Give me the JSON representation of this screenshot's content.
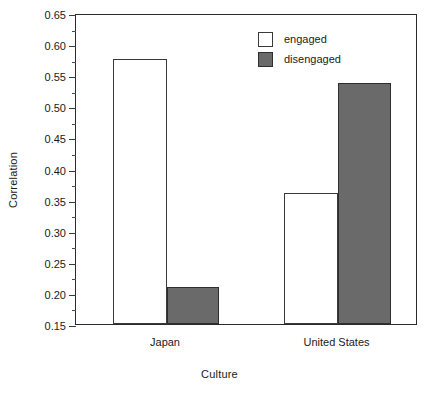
{
  "chart_data": {
    "type": "bar",
    "title": "",
    "xlabel": "Culture",
    "ylabel": "Correlation",
    "categories": [
      "Japan",
      "United States"
    ],
    "series": [
      {
        "name": "engaged",
        "color": "#ffffff",
        "values": [
          0.576,
          0.361
        ]
      },
      {
        "name": "disengaged",
        "color": "#6a6a6a",
        "values": [
          0.21,
          0.537
        ]
      }
    ],
    "ylim": [
      0.15,
      0.65
    ],
    "ytick_step": 0.05,
    "yticks": [
      0.15,
      0.2,
      0.25,
      0.3,
      0.35,
      0.4,
      0.45,
      0.5,
      0.55,
      0.6,
      0.65
    ],
    "ytick_labels": [
      "0.15",
      "0.20",
      "0.25",
      "0.30",
      "0.35",
      "0.40",
      "0.45",
      "0.50",
      "0.55",
      "0.60",
      "0.65"
    ],
    "minor_ticks": [
      0.175,
      0.225,
      0.275,
      0.325,
      0.375,
      0.425,
      0.475,
      0.525,
      0.575,
      0.625
    ],
    "grid": false,
    "legend_position": "top-right-inside",
    "legend_entries": [
      "engaged",
      "disengaged"
    ]
  }
}
